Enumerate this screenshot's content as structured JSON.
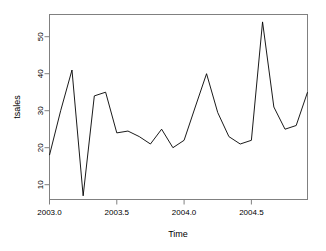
{
  "chart_data": {
    "type": "line",
    "title": "",
    "xlabel": "Time",
    "ylabel": "tsales",
    "xlim": [
      2003.0,
      2004.917
    ],
    "ylim": [
      6.0,
      56.0
    ],
    "grid": false,
    "legend": null,
    "line_color": "#000000",
    "frame_color": "#808080",
    "background": "#FFFFFF",
    "xticks": [
      2003.0,
      2003.5,
      2004.0,
      2004.5
    ],
    "xtick_labels": [
      "2003.0",
      "2003.5",
      "2004.0",
      "2004.5"
    ],
    "yticks": [
      10,
      20,
      30,
      40,
      50
    ],
    "ytick_labels": [
      "10",
      "20",
      "30",
      "40",
      "50"
    ],
    "x": [
      2003.0,
      2003.083,
      2003.167,
      2003.25,
      2003.333,
      2003.417,
      2003.5,
      2003.583,
      2003.667,
      2003.75,
      2003.833,
      2003.917,
      2004.0,
      2004.083,
      2004.167,
      2004.25,
      2004.333,
      2004.417,
      2004.5,
      2004.583,
      2004.667,
      2004.75,
      2004.833,
      2004.917
    ],
    "values": [
      18.0,
      30.0,
      41.0,
      7.0,
      34.0,
      35.0,
      24.0,
      24.5,
      23.0,
      21.0,
      25.0,
      20.0,
      22.0,
      31.0,
      40.0,
      29.5,
      23.0,
      21.0,
      22.0,
      54.0,
      31.0,
      25.0,
      26.0,
      35.0
    ],
    "series": [
      {
        "name": "tsales",
        "values": [
          18.0,
          30.0,
          41.0,
          7.0,
          34.0,
          35.0,
          24.0,
          24.5,
          23.0,
          21.0,
          25.0,
          20.0,
          22.0,
          31.0,
          40.0,
          29.5,
          23.0,
          21.0,
          22.0,
          54.0,
          31.0,
          25.0,
          26.0,
          35.0
        ]
      }
    ]
  }
}
